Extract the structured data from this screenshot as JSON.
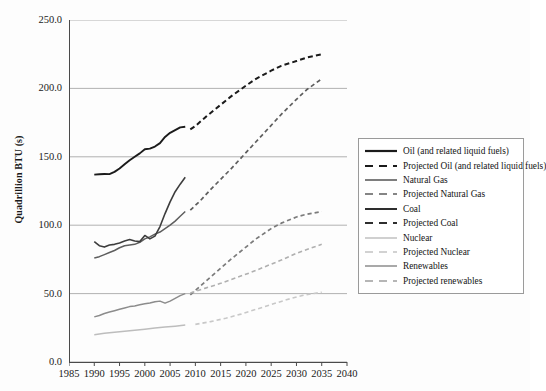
{
  "chart_data": {
    "type": "line",
    "title": "",
    "xlabel": "",
    "ylabel": "Quadrillion BTU (s)",
    "xlim": [
      1985,
      2040
    ],
    "ylim": [
      0.0,
      250.0
    ],
    "grid": true,
    "legend_position": "right",
    "xticks": [
      "1985",
      "1990",
      "1995",
      "2000",
      "2005",
      "2010",
      "2015",
      "2020",
      "2025",
      "2030",
      "2035",
      "2040"
    ],
    "xtick_values": [
      1985,
      1990,
      1995,
      2000,
      2005,
      2010,
      2015,
      2020,
      2025,
      2030,
      2035,
      2040
    ],
    "yticks": [
      "0.0",
      "50.0",
      "100.0",
      "150.0",
      "200.0",
      "250.0"
    ],
    "ytick_values": [
      0.0,
      50.0,
      100.0,
      150.0,
      200.0,
      250.0
    ],
    "series": [
      {
        "name": "Oil (and related liquid fuels)",
        "style": "solid",
        "color": "#1b1b1b",
        "width": 1.9,
        "x": [
          1990,
          1991,
          1992,
          1993,
          1994,
          1995,
          1996,
          1997,
          1998,
          1999,
          2000,
          2001,
          2002,
          2003,
          2004,
          2005,
          2006,
          2007,
          2008
        ],
        "y": [
          137.0,
          137.2,
          137.4,
          137.3,
          139.0,
          141.5,
          144.5,
          147.5,
          150.0,
          152.5,
          155.5,
          156.0,
          157.5,
          160.0,
          164.5,
          167.5,
          169.5,
          171.5,
          172.0
        ]
      },
      {
        "name": "Projected Oil (and related liquid fuels)",
        "style": "dashed",
        "color": "#1b1b1b",
        "width": 2.0,
        "x": [
          2009,
          2010,
          2012,
          2015,
          2017,
          2020,
          2022,
          2025,
          2027,
          2030,
          2032,
          2035
        ],
        "y": [
          170.0,
          172.5,
          179.0,
          188.0,
          194.0,
          202.0,
          207.0,
          213.0,
          216.5,
          220.0,
          222.5,
          225.0
        ]
      },
      {
        "name": "Natural Gas",
        "style": "solid",
        "color": "#5e5e5e",
        "width": 1.5,
        "x": [
          1990,
          1991,
          1992,
          1993,
          1994,
          1995,
          1996,
          1997,
          1998,
          1999,
          2000,
          2001,
          2002,
          2003,
          2004,
          2005,
          2006,
          2007,
          2008
        ],
        "y": [
          76.0,
          77.0,
          78.5,
          80.0,
          81.5,
          83.5,
          85.0,
          85.5,
          86.0,
          87.5,
          90.0,
          91.5,
          93.5,
          95.0,
          97.5,
          100.0,
          103.0,
          106.5,
          110.0
        ]
      },
      {
        "name": "Projected Natural Gas",
        "style": "dashed",
        "color": "#5e5e5e",
        "width": 1.7,
        "x": [
          2009,
          2011,
          2013,
          2015,
          2017,
          2020,
          2022,
          2025,
          2027,
          2030,
          2032,
          2035
        ],
        "y": [
          111.0,
          118.0,
          126.0,
          133.5,
          141.0,
          153.0,
          161.0,
          173.0,
          181.0,
          192.0,
          199.0,
          207.0
        ]
      },
      {
        "name": "Coal",
        "style": "solid",
        "color": "#3d3d3d",
        "width": 1.6,
        "x": [
          1990,
          1991,
          1992,
          1993,
          1994,
          1995,
          1996,
          1997,
          1998,
          1999,
          2000,
          2001,
          2002,
          2003,
          2004,
          2005,
          2006,
          2007,
          2008
        ],
        "y": [
          88.0,
          85.0,
          84.0,
          85.5,
          86.0,
          87.0,
          88.5,
          89.5,
          88.5,
          88.0,
          92.5,
          90.0,
          92.0,
          99.0,
          108.5,
          117.0,
          124.5,
          130.0,
          135.0
        ]
      },
      {
        "name": "Projected Coal",
        "style": "dashed",
        "color": "#7b7b7b",
        "width": 1.7,
        "x": [
          2009,
          2011,
          2013,
          2015,
          2017,
          2020,
          2022,
          2025,
          2027,
          2030,
          2032,
          2035
        ],
        "y": [
          49.0,
          55.5,
          62.0,
          68.5,
          75.0,
          84.0,
          90.0,
          97.5,
          101.5,
          106.0,
          108.0,
          110.0
        ]
      },
      {
        "name": "Nuclear",
        "style": "solid",
        "color": "#bdbdbd",
        "width": 1.5,
        "x": [
          1990,
          1992,
          1994,
          1996,
          1998,
          2000,
          2002,
          2004,
          2006,
          2008
        ],
        "y": [
          20.0,
          21.0,
          21.8,
          22.5,
          23.2,
          24.0,
          24.8,
          25.5,
          26.2,
          27.0
        ]
      },
      {
        "name": "Projected Nuclear",
        "style": "dashed",
        "color": "#c8c8c8",
        "width": 1.6,
        "x": [
          2010,
          2013,
          2016,
          2019,
          2022,
          2025,
          2028,
          2031,
          2034,
          2035
        ],
        "y": [
          27.5,
          29.5,
          32.0,
          35.0,
          38.5,
          42.0,
          45.5,
          48.5,
          50.5,
          51.0
        ]
      },
      {
        "name": "Renewables",
        "style": "solid",
        "color": "#8c8c8c",
        "width": 1.5,
        "x": [
          1990,
          1991,
          1992,
          1993,
          1994,
          1995,
          1996,
          1997,
          1998,
          1999,
          2000,
          2001,
          2002,
          2003,
          2004,
          2005,
          2006,
          2007,
          2008
        ],
        "y": [
          33.0,
          34.0,
          35.5,
          36.5,
          37.5,
          38.5,
          39.5,
          40.5,
          41.0,
          41.8,
          42.5,
          43.2,
          44.0,
          44.5,
          43.0,
          44.5,
          46.5,
          48.5,
          50.0
        ]
      },
      {
        "name": "Projected renewables",
        "style": "dashed",
        "color": "#b0b0b0",
        "width": 1.6,
        "x": [
          2009,
          2012,
          2015,
          2018,
          2021,
          2024,
          2027,
          2030,
          2033,
          2035
        ],
        "y": [
          50.5,
          54.0,
          57.5,
          61.5,
          65.5,
          70.0,
          74.5,
          79.5,
          83.5,
          86.0
        ]
      }
    ]
  },
  "legend": {
    "items": [
      {
        "label": "Oil (and related liquid fuels)",
        "style": "solid",
        "color": "#1b1b1b",
        "width": 2.2
      },
      {
        "label": "Projected Oil (and related liquid fuels)",
        "style": "dashed",
        "color": "#1b1b1b",
        "width": 2.2
      },
      {
        "label": "Natural Gas",
        "style": "solid",
        "color": "#5e5e5e",
        "width": 1.6
      },
      {
        "label": "Projected Natural Gas",
        "style": "dashed",
        "color": "#5e5e5e",
        "width": 1.6
      },
      {
        "label": "Coal",
        "style": "solid",
        "color": "#2e2e2e",
        "width": 2.0
      },
      {
        "label": "Projected Coal",
        "style": "dashed",
        "color": "#2e2e2e",
        "width": 2.0
      },
      {
        "label": "Nuclear",
        "style": "solid",
        "color": "#c0c0c0",
        "width": 1.5
      },
      {
        "label": "Projected Nuclear",
        "style": "dashed",
        "color": "#c4c4c4",
        "width": 1.5
      },
      {
        "label": "Renewables",
        "style": "solid",
        "color": "#8c8c8c",
        "width": 1.5
      },
      {
        "label": "Projected renewables",
        "style": "dashed",
        "color": "#9e9e9e",
        "width": 1.5
      }
    ]
  },
  "axis": {
    "grid_color": "#a9a9a9",
    "axis_color": "#4a4a4a"
  }
}
